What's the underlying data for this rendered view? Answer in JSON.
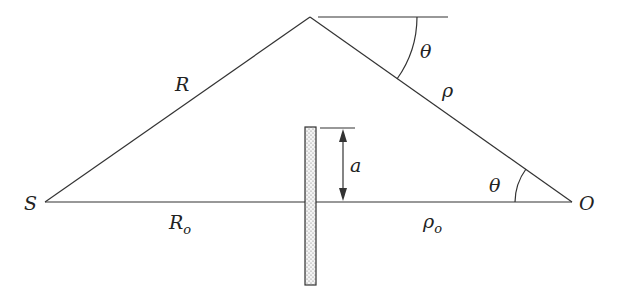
{
  "diagram": {
    "points": {
      "source": {
        "label": "S",
        "x": 45,
        "y": 202
      },
      "observer": {
        "label": "O",
        "x": 572,
        "y": 202
      },
      "apex": {
        "x": 310,
        "y": 17
      }
    },
    "labels": {
      "R": "R",
      "R_o_main": "R",
      "R_o_sub": "o",
      "rho": "ρ",
      "rho_o_main": "ρ",
      "rho_o_sub": "o",
      "theta_top": "θ",
      "theta_bottom": "θ",
      "a": "a",
      "S": "S",
      "O": "O"
    },
    "colors": {
      "line": "#333333",
      "text": "#222222",
      "barrier_fill": "#e8e8e8"
    }
  }
}
